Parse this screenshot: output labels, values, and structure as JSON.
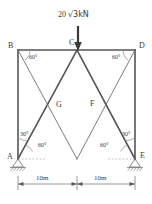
{
  "diagram": {
    "type": "structural-frame-truss",
    "load": {
      "magnitude": "20",
      "radical": "√3kN",
      "full_label": "20 √3kN",
      "direction": "down",
      "applied_at": "C"
    },
    "nodes": {
      "A": "A",
      "B": "B",
      "C": "C",
      "D": "D",
      "E": "E",
      "F": "F",
      "G": "G"
    },
    "angles": {
      "b_top": "60°",
      "d_top": "60°",
      "a_inner": "30°",
      "a_outer": "60°",
      "e_inner": "30°",
      "e_outer": "60°"
    },
    "dimensions": {
      "left_span": "10m",
      "right_span": "10m"
    },
    "supports": {
      "left": "pinned-hatched",
      "right": "pinned-hatched"
    },
    "colors": {
      "member": "#555555",
      "thin_line": "#777777",
      "text": "#3a3a3a",
      "background": "#ffffff"
    }
  }
}
